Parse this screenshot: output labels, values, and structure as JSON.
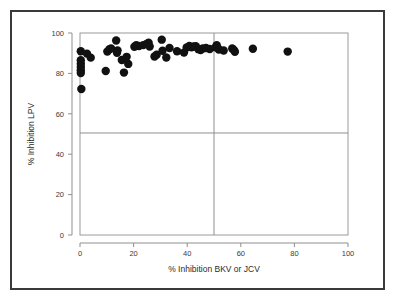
{
  "chart_data": {
    "type": "scatter",
    "title": "",
    "xlabel": "% Inhibition BKV or JCV",
    "ylabel": "% Inhibition LPV",
    "xlim": [
      0,
      100
    ],
    "ylim": [
      0,
      100
    ],
    "xticks": [
      0,
      20,
      40,
      60,
      80,
      100
    ],
    "yticks": [
      0,
      20,
      40,
      60,
      80,
      100
    ],
    "xtick_labels": [
      "0",
      "20",
      "40",
      "60",
      "80",
      "100"
    ],
    "ytick_labels": [
      "0",
      "20",
      "40",
      "60",
      "80",
      "100"
    ],
    "grid": false,
    "legend": null,
    "marker_color": "#111111",
    "marker_shape": "circle",
    "marker_size_px": 4.2,
    "reference_lines": [
      {
        "orientation": "vertical",
        "value": 50,
        "color": "#8f8f8f"
      },
      {
        "orientation": "horizontal",
        "value": 50.5,
        "color": "#8f8f8f"
      }
    ],
    "points": [
      [
        0.3,
        91.0
      ],
      [
        0.3,
        86.5
      ],
      [
        0.3,
        84.8
      ],
      [
        0.3,
        83.2
      ],
      [
        0.3,
        81.6
      ],
      [
        0.3,
        80.2
      ],
      [
        0.5,
        72.3
      ],
      [
        2.6,
        89.8
      ],
      [
        4.0,
        87.8
      ],
      [
        9.6,
        81.2
      ],
      [
        10.2,
        90.8
      ],
      [
        11.0,
        92.0
      ],
      [
        11.6,
        92.4
      ],
      [
        13.5,
        96.3
      ],
      [
        13.8,
        90.2
      ],
      [
        14.0,
        91.4
      ],
      [
        15.6,
        86.6
      ],
      [
        16.4,
        80.4
      ],
      [
        17.4,
        88.2
      ],
      [
        18.0,
        84.7
      ],
      [
        20.3,
        93.2
      ],
      [
        21.0,
        94.0
      ],
      [
        22.0,
        93.6
      ],
      [
        23.6,
        94.0
      ],
      [
        24.8,
        94.6
      ],
      [
        25.6,
        95.2
      ],
      [
        26.0,
        93.3
      ],
      [
        27.8,
        88.4
      ],
      [
        28.6,
        89.2
      ],
      [
        30.5,
        96.7
      ],
      [
        30.8,
        91.2
      ],
      [
        32.2,
        87.9
      ],
      [
        33.4,
        92.6
      ],
      [
        36.2,
        91.0
      ],
      [
        38.8,
        90.3
      ],
      [
        39.8,
        92.8
      ],
      [
        40.8,
        93.6
      ],
      [
        41.6,
        92.9
      ],
      [
        42.4,
        93.3
      ],
      [
        43.2,
        93.5
      ],
      [
        44.2,
        92.0
      ],
      [
        45.0,
        91.6
      ],
      [
        45.8,
        92.3
      ],
      [
        47.0,
        92.6
      ],
      [
        48.4,
        92.1
      ],
      [
        50.6,
        92.9
      ],
      [
        51.0,
        94.0
      ],
      [
        51.4,
        92.6
      ],
      [
        51.8,
        91.8
      ],
      [
        53.6,
        91.3
      ],
      [
        56.8,
        92.3
      ],
      [
        57.4,
        91.6
      ],
      [
        57.8,
        90.7
      ],
      [
        64.5,
        92.2
      ],
      [
        77.5,
        90.8
      ]
    ]
  },
  "figure": {
    "background_color": "#ffffff",
    "border_color": "#3a3a3a"
  }
}
